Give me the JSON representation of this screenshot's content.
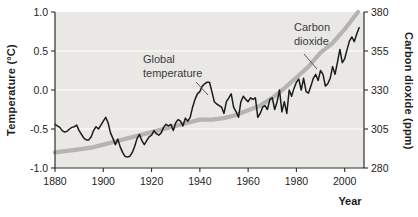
{
  "figure": {
    "x_title": "Year",
    "left_axis_title": "Temperature (°C)",
    "right_axis_title": "Carbon dioxide (ppm)",
    "annotations": {
      "global_temperature": {
        "line1": "Global",
        "line2": "temperature"
      },
      "carbon_dioxide": {
        "line1": "Carbon",
        "line2": "dioxide"
      }
    },
    "colors": {
      "plot_bg": "#e9e8e5",
      "grid": "#f8f8f5",
      "spine": "#2e2e2e",
      "tick_text": "#1e1e1e",
      "temperature_line": "#1b1b1b",
      "co2_line": "#b5b4b1",
      "leader_line": "#5a5a5a"
    }
  },
  "chart_data": {
    "type": "line",
    "title": "",
    "xlabel": "Year",
    "ylabel_left": "Temperature (°C)",
    "ylabel_right": "Carbon dioxide (ppm)",
    "xlim": [
      1880,
      2008
    ],
    "ylim_left": [
      -1.0,
      1.0
    ],
    "ylim_right": [
      280,
      380
    ],
    "x_ticks": [
      1880,
      1900,
      1920,
      1940,
      1960,
      1980,
      2000
    ],
    "x_tick_labels": [
      "1880",
      "1900",
      "1920",
      "1940",
      "1960",
      "1980",
      "2000"
    ],
    "y_left_ticks": [
      1.0,
      0.5,
      0.0,
      -0.5,
      -1.0
    ],
    "y_left_tick_labels": [
      "1.0",
      "0.5",
      "0.0",
      "-0.5",
      "-1.0"
    ],
    "y_right_ticks": [
      380,
      355,
      330,
      305,
      280
    ],
    "y_right_tick_labels": [
      "380",
      "355",
      "330",
      "305",
      "280"
    ],
    "grid_lines_left_values": [
      0.5,
      0.0,
      -0.5
    ],
    "legend_position": "annotated-on-plot",
    "series": [
      {
        "name": "Global temperature",
        "axis": "left",
        "units": "°C",
        "x_start": 1880,
        "x_step": 1,
        "values": [
          -0.44,
          -0.46,
          -0.48,
          -0.52,
          -0.54,
          -0.53,
          -0.5,
          -0.48,
          -0.47,
          -0.45,
          -0.52,
          -0.57,
          -0.62,
          -0.64,
          -0.64,
          -0.6,
          -0.52,
          -0.47,
          -0.5,
          -0.45,
          -0.4,
          -0.35,
          -0.42,
          -0.55,
          -0.62,
          -0.7,
          -0.63,
          -0.73,
          -0.8,
          -0.85,
          -0.86,
          -0.85,
          -0.8,
          -0.72,
          -0.62,
          -0.57,
          -0.65,
          -0.7,
          -0.65,
          -0.6,
          -0.58,
          -0.52,
          -0.56,
          -0.58,
          -0.55,
          -0.48,
          -0.44,
          -0.46,
          -0.44,
          -0.52,
          -0.42,
          -0.38,
          -0.4,
          -0.46,
          -0.36,
          -0.4,
          -0.35,
          -0.22,
          -0.12,
          -0.05,
          -0.02,
          0.05,
          0.08,
          0.1,
          0.1,
          -0.02,
          -0.15,
          -0.18,
          -0.2,
          -0.22,
          -0.3,
          -0.15,
          -0.1,
          -0.05,
          -0.22,
          -0.28,
          -0.35,
          -0.15,
          -0.08,
          -0.12,
          -0.15,
          -0.1,
          -0.12,
          -0.1,
          -0.35,
          -0.3,
          -0.22,
          -0.2,
          -0.25,
          -0.12,
          -0.1,
          -0.25,
          -0.15,
          0.0,
          -0.28,
          -0.15,
          -0.3,
          0.0,
          -0.08,
          0.02,
          0.1,
          0.14,
          0.0,
          0.15,
          -0.02,
          -0.04,
          0.05,
          0.15,
          0.2,
          0.12,
          0.25,
          0.2,
          0.05,
          0.08,
          0.15,
          0.3,
          0.2,
          0.35,
          0.52,
          0.35,
          0.4,
          0.52,
          0.63,
          0.68,
          0.62,
          0.72,
          0.8
        ]
      },
      {
        "name": "Carbon dioxide",
        "axis": "right",
        "units": "ppm",
        "x": [
          1880,
          1885,
          1890,
          1895,
          1900,
          1905,
          1910,
          1915,
          1920,
          1925,
          1930,
          1935,
          1940,
          1945,
          1950,
          1955,
          1960,
          1965,
          1970,
          1975,
          1980,
          1985,
          1990,
          1995,
          2000,
          2005.5
        ],
        "values": [
          290,
          291,
          292,
          293,
          295,
          297,
          299,
          301,
          303,
          305,
          307,
          309,
          311,
          311,
          312,
          314,
          317,
          320,
          325,
          331,
          338,
          345,
          354,
          360,
          369,
          380
        ]
      }
    ]
  }
}
